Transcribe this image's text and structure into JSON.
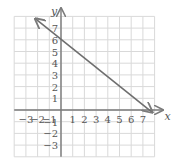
{
  "chart_data": {
    "type": "line",
    "title": "",
    "xlabel": "x",
    "ylabel": "y",
    "xlim": [
      -4,
      8
    ],
    "ylim": [
      -4,
      8
    ],
    "grid": true,
    "x_ticks": [
      "-3",
      "-2",
      "-1",
      "1",
      "2",
      "3",
      "4",
      "5",
      "6",
      "7"
    ],
    "y_ticks": [
      "-3",
      "-2",
      "-1",
      "1",
      "2",
      "3",
      "4",
      "5",
      "6",
      "7"
    ],
    "series": [
      {
        "name": "line",
        "description": "Straight line through (0, 6) and (7.5, 0) with arrows at both ends",
        "x": [
          -2.2,
          7.8
        ],
        "y": [
          7.8,
          -0.2
        ],
        "points": [
          [
            0,
            6
          ],
          [
            7.5,
            0
          ]
        ]
      }
    ]
  },
  "colors": {
    "grid": "#d9d9d9",
    "axis": "#7a7a7a",
    "line": "#6e6e6e",
    "text": "#555555"
  }
}
